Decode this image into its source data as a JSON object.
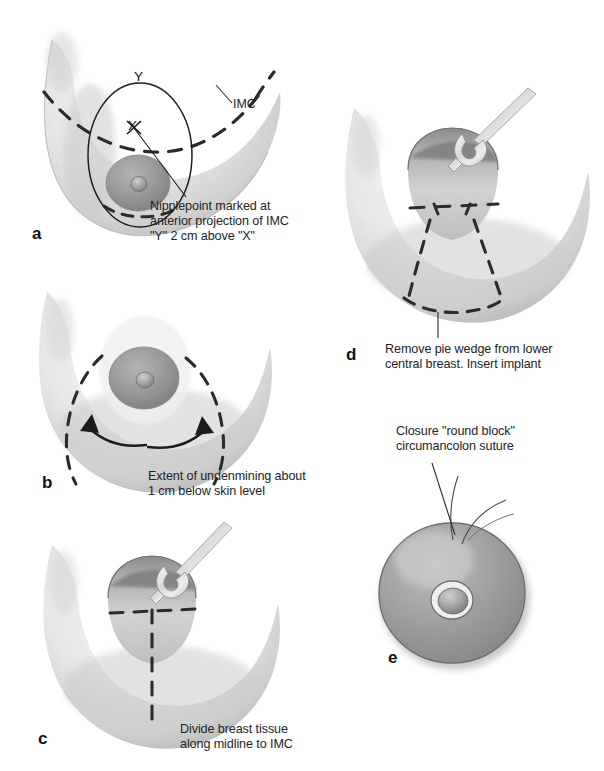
{
  "figure": {
    "background_color": "#ffffff",
    "ink_color": "#242424",
    "tissue_light": "#f2f2f2",
    "tissue_mid": "#d9d9d9",
    "tissue_dark": "#b4b4b4",
    "areola_color": "#9a9a9a",
    "dash_color": "#2a2a2a"
  },
  "panels": [
    {
      "id": "a",
      "letter": "a",
      "caption": "Nipplepoint marked at\nanterior projection of IMC\n\"Y\" 2 cm above \"X\"",
      "annotations": [
        {
          "name": "imc-label",
          "text": "IMC"
        },
        {
          "name": "point-y-label",
          "text": "Y"
        },
        {
          "name": "point-x-label",
          "text": "X"
        }
      ]
    },
    {
      "id": "b",
      "letter": "b",
      "caption": "Extent of undenmining about\n1 cm below skin level",
      "annotations": []
    },
    {
      "id": "c",
      "letter": "c",
      "caption": "Divide breast tissue\nalong midline to IMC",
      "annotations": []
    },
    {
      "id": "d",
      "letter": "d",
      "caption": "Remove pie wedge from lower\ncentral breast. Insert implant",
      "annotations": []
    },
    {
      "id": "e",
      "letter": "e",
      "caption": "Closure \"round block\"\ncircumancolon suture",
      "annotations": []
    }
  ]
}
